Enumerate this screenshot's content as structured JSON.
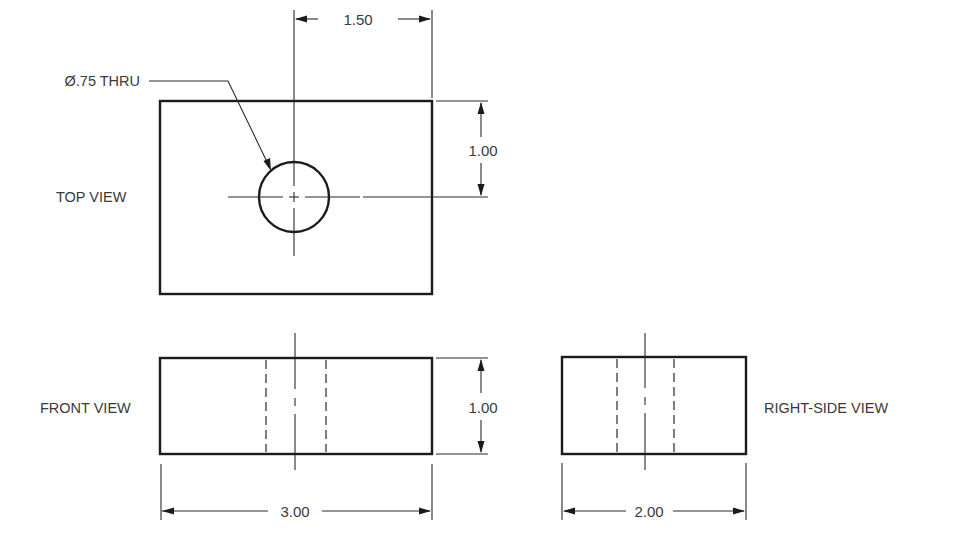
{
  "drawing": {
    "title": "Multiview orthographic drawing of a block with a through hole",
    "units": "inches",
    "views": {
      "top": {
        "label": "TOP VIEW"
      },
      "front": {
        "label": "FRONT VIEW"
      },
      "right_side": {
        "label": "RIGHT-SIDE VIEW"
      }
    },
    "part": {
      "width": 3.0,
      "depth": 2.0,
      "height": 1.0,
      "hole_diameter": 0.75,
      "hole_center_from_right": 1.5,
      "hole_center_from_back": 1.0
    },
    "dimensions": {
      "hole_callout": "Ø.75 THRU",
      "hole_location_x": "1.50",
      "hole_location_y": "1.00",
      "height": "1.00",
      "width": "3.00",
      "depth": "2.00"
    },
    "colors": {
      "line": "#1a1a1a",
      "text": "#3a3a3a",
      "background": "#ffffff"
    }
  }
}
